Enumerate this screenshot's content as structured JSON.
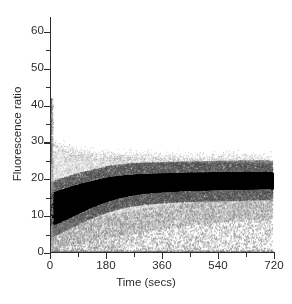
{
  "figure": {
    "background": "#ffffff",
    "ink": "#2b2b2b"
  },
  "chart_data": {
    "type": "scatter",
    "title": "",
    "subtitle": "",
    "xlabel": "Time (secs)",
    "ylabel": "Fluorescence ratio",
    "xlim": [
      0,
      720
    ],
    "ylim": [
      0,
      64
    ],
    "xticks": [
      0,
      180,
      360,
      540,
      720
    ],
    "xtick_labels": [
      "0",
      "180",
      "360",
      "540",
      "720"
    ],
    "xticks_minor": [
      90,
      270,
      450,
      630
    ],
    "yticks": [
      0,
      10,
      20,
      30,
      40,
      50,
      60
    ],
    "ytick_labels": [
      "0",
      "10",
      "20",
      "30",
      "40",
      "50",
      "60"
    ],
    "yticks_minor": [
      5,
      15,
      25,
      35,
      45,
      55
    ],
    "grid": false,
    "legend": null,
    "legend_position": "none",
    "series": [
      {
        "name": "core-band-upper",
        "role": "dense-black-envelope-upper",
        "color": "#000000",
        "x": [
          0,
          15,
          30,
          45,
          60,
          80,
          100,
          120,
          140,
          160,
          180,
          220,
          260,
          300,
          340,
          380,
          420,
          460,
          500,
          540,
          580,
          620,
          660,
          700,
          715
        ],
        "values": [
          16.2,
          16.6,
          17.0,
          17.4,
          17.8,
          18.3,
          18.8,
          19.2,
          19.6,
          20.0,
          20.4,
          20.9,
          21.2,
          21.4,
          21.5,
          21.6,
          21.7,
          21.8,
          21.8,
          21.9,
          21.9,
          22.0,
          22.0,
          22.0,
          21.8
        ]
      },
      {
        "name": "core-band-lower",
        "role": "dense-black-envelope-lower",
        "color": "#000000",
        "x": [
          0,
          15,
          30,
          45,
          60,
          80,
          100,
          120,
          140,
          160,
          180,
          220,
          260,
          300,
          340,
          380,
          420,
          460,
          500,
          540,
          580,
          620,
          660,
          700,
          715
        ],
        "values": [
          7.4,
          8.0,
          8.6,
          9.2,
          9.8,
          10.6,
          11.4,
          12.2,
          12.9,
          13.6,
          14.2,
          15.2,
          15.9,
          16.4,
          16.7,
          16.9,
          17.1,
          17.2,
          17.3,
          17.4,
          17.5,
          17.5,
          17.6,
          17.7,
          17.5
        ]
      },
      {
        "name": "median-trace",
        "role": "band-centre",
        "color": "#000000",
        "x": [
          0,
          15,
          30,
          45,
          60,
          80,
          100,
          120,
          140,
          160,
          180,
          220,
          260,
          300,
          340,
          380,
          420,
          460,
          500,
          540,
          580,
          620,
          660,
          700,
          715
        ],
        "values": [
          11.8,
          12.3,
          12.8,
          13.3,
          13.8,
          14.5,
          15.1,
          15.7,
          16.3,
          16.8,
          17.3,
          18.1,
          18.6,
          18.9,
          19.1,
          19.3,
          19.4,
          19.5,
          19.6,
          19.7,
          19.7,
          19.8,
          19.8,
          19.9,
          19.7
        ]
      },
      {
        "name": "grey-halo-upper",
        "role": "light-grey-scatter-upper",
        "color": "#b5b5b5",
        "x": [
          0,
          15,
          30,
          45,
          60,
          80,
          100,
          120,
          140,
          160,
          180,
          220,
          260,
          300,
          340,
          380,
          420,
          460,
          500,
          540,
          580,
          620,
          660,
          700,
          715
        ],
        "values": [
          30.0,
          28.5,
          27.5,
          27.0,
          26.5,
          26.2,
          26.0,
          25.8,
          25.6,
          25.5,
          25.4,
          25.2,
          25.0,
          25.0,
          24.9,
          24.8,
          24.8,
          24.7,
          24.7,
          24.6,
          24.6,
          24.6,
          24.5,
          24.5,
          24.4
        ]
      },
      {
        "name": "grey-halo-lower",
        "role": "light-grey-scatter-lower",
        "color": "#b5b5b5",
        "x": [
          0,
          15,
          30,
          45,
          60,
          80,
          100,
          120,
          140,
          160,
          180,
          220,
          260,
          300,
          340,
          380,
          420,
          460,
          500,
          540,
          580,
          620,
          660,
          700,
          715
        ],
        "values": [
          1.5,
          1.6,
          1.8,
          2.0,
          2.2,
          2.5,
          2.8,
          3.1,
          3.4,
          3.7,
          4.0,
          4.6,
          5.2,
          5.8,
          6.3,
          6.8,
          7.2,
          7.6,
          8.0,
          8.3,
          8.6,
          8.9,
          9.1,
          9.3,
          9.3
        ]
      },
      {
        "name": "sparse-outliers-t0",
        "role": "vertical-spray-at-origin",
        "color": "#c9c9c9",
        "x": [
          0,
          0,
          0,
          0,
          0,
          0,
          0
        ],
        "values": [
          41.0,
          38.0,
          35.0,
          33.0,
          31.0,
          28.0,
          24.0
        ]
      },
      {
        "name": "baseline-floor",
        "role": "zero-line-cluster",
        "color": "#9a9a9a",
        "x": [
          0,
          90,
          180,
          270,
          360,
          450,
          540,
          630,
          715
        ],
        "values": [
          0.3,
          0.3,
          0.3,
          0.3,
          0.3,
          0.3,
          0.3,
          0.3,
          0.3
        ]
      }
    ]
  }
}
